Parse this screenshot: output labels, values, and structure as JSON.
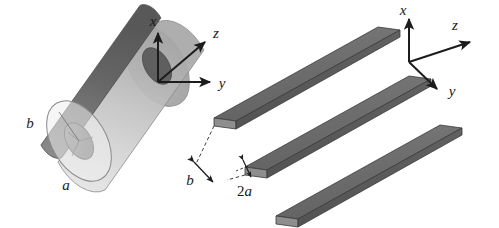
{
  "figure": {
    "name": "geometry-comparison-figure",
    "background_color": "#ffffff",
    "panels": [
      {
        "id": "cylinder-panel",
        "name": "coaxial-cylinder-geometry",
        "description": "Translucent outer cylinder of radius b enclosing a solid dark inner cylindrical core of radius a, drawn in oblique 3D view.",
        "axes": {
          "name": "axis-triad-cylinder",
          "origin_label": "",
          "x_label": "x",
          "y_label": "y",
          "z_label": "z",
          "x_direction": "up",
          "y_direction": "right",
          "z_direction": "up-right-diagonal"
        },
        "dimensions": [
          {
            "label": "b",
            "meaning": "outer cylinder radius"
          },
          {
            "label": "a",
            "meaning": "inner core radius"
          }
        ],
        "colors": {
          "shell_fill": "#c9c9c9",
          "shell_stroke": "#8a8a8a",
          "core_fill": "#707070",
          "core_dark": "#5d5d5d",
          "core_light": "#909090"
        }
      },
      {
        "id": "slabs-panel",
        "name": "parallel-slabs-geometry",
        "description": "Three identical parallel rectangular slabs of thickness 2a separated by gap b, drawn in oblique 3D view.",
        "slab_count": 3,
        "axes": {
          "name": "axis-triad-slabs",
          "x_label": "x",
          "y_label": "y",
          "z_label": "z",
          "x_direction": "up",
          "y_direction": "down-right-diagonal",
          "z_direction": "up-right-diagonal"
        },
        "dimensions": [
          {
            "label": "b",
            "meaning": "center-to-center spacing between slabs"
          },
          {
            "label": "2a",
            "meaning": "slab thickness"
          }
        ],
        "colors": {
          "slab_top": "#6f6f6f",
          "slab_side": "#5a5a5a",
          "slab_end": "#8c8c8c",
          "slab_stroke": "#3a3a3a",
          "dimension_line": "#2a2a2a"
        }
      }
    ]
  },
  "labels": {
    "cyl_x": "x",
    "cyl_y": "y",
    "cyl_z": "z",
    "cyl_b": "b",
    "cyl_a": "a",
    "slab_x": "x",
    "slab_y": "y",
    "slab_z": "z",
    "slab_b": "b",
    "slab_2a_num": "2",
    "slab_2a_var": "a"
  }
}
